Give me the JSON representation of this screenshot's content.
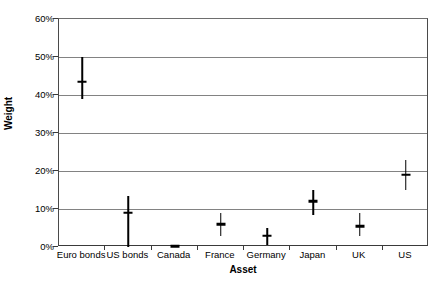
{
  "chart_data": {
    "type": "scatter",
    "title": "",
    "xlabel": "Asset",
    "ylabel": "Weight",
    "categories": [
      "Euro bonds",
      "US bonds",
      "Canada",
      "France",
      "Germany",
      "Japan",
      "UK",
      "US"
    ],
    "series": [
      {
        "name": "Weight",
        "values": [
          43.5,
          9.0,
          0.2,
          6.0,
          3.0,
          12.0,
          5.5,
          19.0
        ],
        "low": [
          39.0,
          0.0,
          0.0,
          3.0,
          0.5,
          8.5,
          3.0,
          15.0
        ],
        "high": [
          50.0,
          13.5,
          0.5,
          9.0,
          5.0,
          15.0,
          9.0,
          23.0
        ]
      }
    ],
    "ylim": [
      0,
      60
    ],
    "yticks": [
      0,
      10,
      20,
      30,
      40,
      50,
      60
    ],
    "ytick_labels": [
      "0%",
      "10%",
      "20%",
      "30%",
      "40%",
      "50%",
      "60%"
    ],
    "grid": true,
    "legend": "none",
    "marker_color": "#000000",
    "gridline_color": "#828282",
    "axis_color": "#3a3a3a",
    "background_color": "#ffffff"
  }
}
